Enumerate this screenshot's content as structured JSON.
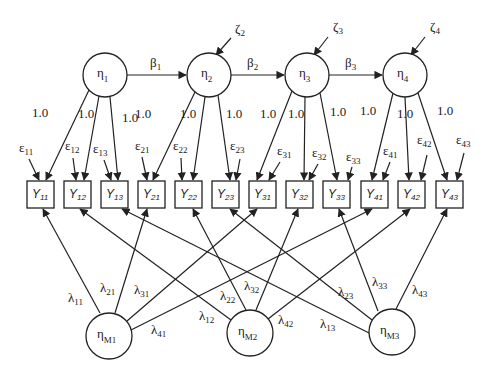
{
  "diagram": {
    "type": "structural-equation-model",
    "latent_factors": [
      {
        "id": "eta1",
        "symbol": "η",
        "sub": "1",
        "cx": 105,
        "cy": 75,
        "r": 22
      },
      {
        "id": "eta2",
        "symbol": "η",
        "sub": "2",
        "cx": 209,
        "cy": 75,
        "r": 22
      },
      {
        "id": "eta3",
        "symbol": "η",
        "sub": "3",
        "cx": 307,
        "cy": 75,
        "r": 22
      },
      {
        "id": "eta4",
        "symbol": "η",
        "sub": "4",
        "cx": 405,
        "cy": 75,
        "r": 22
      }
    ],
    "method_factors": [
      {
        "id": "etaM1",
        "symbol": "η",
        "sub": "M1",
        "cx": 109,
        "cy": 336,
        "r": 23
      },
      {
        "id": "etaM2",
        "symbol": "η",
        "sub": "M2",
        "cx": 250,
        "cy": 333,
        "r": 23
      },
      {
        "id": "etaM3",
        "symbol": "η",
        "sub": "M3",
        "cx": 392,
        "cy": 332,
        "r": 23
      }
    ],
    "disturbances": [
      {
        "id": "zeta2",
        "symbol": "ζ",
        "sub": "2",
        "target": "eta2",
        "lx": 235,
        "ly": 33,
        "x1": 231,
        "y1": 38,
        "x2": 216,
        "y2": 55
      },
      {
        "id": "zeta3",
        "symbol": "ζ",
        "sub": "3",
        "target": "eta3",
        "lx": 333,
        "ly": 31,
        "x1": 328,
        "y1": 37,
        "x2": 314,
        "y2": 55
      },
      {
        "id": "zeta4",
        "symbol": "ζ",
        "sub": "4",
        "target": "eta4",
        "lx": 430,
        "ly": 31,
        "x1": 425,
        "y1": 37,
        "x2": 411,
        "y2": 55
      }
    ],
    "structural_paths": [
      {
        "label": "β",
        "sub": "1",
        "from": "eta1",
        "to": "eta2",
        "lx": 150,
        "ly": 67
      },
      {
        "label": "β",
        "sub": "2",
        "from": "eta2",
        "to": "eta3",
        "lx": 247,
        "ly": 67
      },
      {
        "label": "β",
        "sub": "3",
        "from": "eta3",
        "to": "eta4",
        "lx": 345,
        "ly": 67
      }
    ],
    "indicators": [
      {
        "id": "Y11",
        "symbol": "Y",
        "sub": "11",
        "x": 27,
        "factor": "eta1",
        "method": "etaM1"
      },
      {
        "id": "Y12",
        "symbol": "Y",
        "sub": "12",
        "x": 64,
        "factor": "eta1",
        "method": "etaM2"
      },
      {
        "id": "Y13",
        "symbol": "Y",
        "sub": "13",
        "x": 101,
        "factor": "eta1",
        "method": "etaM3"
      },
      {
        "id": "Y21",
        "symbol": "Y",
        "sub": "21",
        "x": 138,
        "factor": "eta2",
        "method": "etaM1"
      },
      {
        "id": "Y22",
        "symbol": "Y",
        "sub": "22",
        "x": 175,
        "factor": "eta2",
        "method": "etaM2"
      },
      {
        "id": "Y23",
        "symbol": "Y",
        "sub": "23",
        "x": 212,
        "factor": "eta2",
        "method": "etaM3"
      },
      {
        "id": "Y31",
        "symbol": "Y",
        "sub": "31",
        "x": 249,
        "factor": "eta3",
        "method": "etaM1"
      },
      {
        "id": "Y32",
        "symbol": "Y",
        "sub": "32",
        "x": 286,
        "factor": "eta3",
        "method": "etaM2"
      },
      {
        "id": "Y33",
        "symbol": "Y",
        "sub": "33",
        "x": 323,
        "factor": "eta3",
        "method": "etaM3"
      },
      {
        "id": "Y41",
        "symbol": "Y",
        "sub": "41",
        "x": 361,
        "factor": "eta4",
        "method": "etaM1"
      },
      {
        "id": "Y42",
        "symbol": "Y",
        "sub": "42",
        "x": 398,
        "factor": "eta4",
        "method": "etaM2"
      },
      {
        "id": "Y43",
        "symbol": "Y",
        "sub": "43",
        "x": 436,
        "factor": "eta4",
        "method": "etaM3"
      }
    ],
    "indicator_box": {
      "y": 181,
      "w": 27,
      "h": 27
    },
    "factor_loadings": [
      {
        "from": "eta1",
        "to": "Y11",
        "label": "1.0",
        "lx": 32,
        "ly": 117,
        "ex": 46,
        "fx": 89,
        "fy": 90
      },
      {
        "from": "eta1",
        "to": "Y12",
        "label": "1.0",
        "lx": 78,
        "ly": 118,
        "ex": 84,
        "fx": 99,
        "fy": 96
      },
      {
        "from": "eta1",
        "to": "Y13",
        "label": "1.0",
        "lx": 122,
        "ly": 122,
        "ex": 118,
        "fx": 110,
        "fy": 97
      },
      {
        "from": "eta2",
        "to": "Y21",
        "label": "1.0",
        "lx": 135,
        "ly": 118,
        "ex": 153,
        "fx": 195,
        "fy": 92
      },
      {
        "from": "eta2",
        "to": "Y22",
        "label": "1.0",
        "lx": 180,
        "ly": 118,
        "ex": 193,
        "fx": 205,
        "fy": 97
      },
      {
        "from": "eta2",
        "to": "Y23",
        "label": "1.0",
        "lx": 226,
        "ly": 118,
        "ex": 230,
        "fx": 218,
        "fy": 95
      },
      {
        "from": "eta3",
        "to": "Y31",
        "label": "1.0",
        "lx": 260,
        "ly": 118,
        "ex": 257,
        "fx": 292,
        "fy": 91
      },
      {
        "from": "eta3",
        "to": "Y32",
        "label": "1.0",
        "lx": 288,
        "ly": 118,
        "ex": 304,
        "fx": 305,
        "fy": 97
      },
      {
        "from": "eta3",
        "to": "Y33",
        "label": "1.0",
        "lx": 330,
        "ly": 116,
        "ex": 337,
        "fx": 320,
        "fy": 93
      },
      {
        "from": "eta4",
        "to": "Y41",
        "label": "1.0",
        "lx": 360,
        "ly": 115,
        "ex": 372,
        "fx": 393,
        "fy": 93
      },
      {
        "from": "eta4",
        "to": "Y42",
        "label": "1.0",
        "lx": 397,
        "ly": 118,
        "ex": 409,
        "fx": 405,
        "fy": 97
      },
      {
        "from": "eta4",
        "to": "Y43",
        "label": "1.0",
        "lx": 437,
        "ly": 115,
        "ex": 447,
        "fx": 418,
        "fy": 93
      }
    ],
    "measurement_errors": [
      {
        "target": "Y11",
        "symbol": "ε",
        "sub": "11",
        "lx": 19,
        "ly": 152,
        "x1": 29,
        "y1": 159,
        "x2": 39,
        "y2": 180
      },
      {
        "target": "Y12",
        "symbol": "ε",
        "sub": "12",
        "lx": 65,
        "ly": 150,
        "x1": 73,
        "y1": 158,
        "x2": 76,
        "y2": 180
      },
      {
        "target": "Y13",
        "symbol": "ε",
        "sub": "13",
        "lx": 93,
        "ly": 153,
        "x1": 104,
        "y1": 160,
        "x2": 111,
        "y2": 180
      },
      {
        "target": "Y21",
        "symbol": "ε",
        "sub": "21",
        "lx": 135,
        "ly": 150,
        "x1": 142,
        "y1": 157,
        "x2": 147,
        "y2": 180
      },
      {
        "target": "Y22",
        "symbol": "ε",
        "sub": "22",
        "lx": 173,
        "ly": 150,
        "x1": 181,
        "y1": 158,
        "x2": 182,
        "y2": 180
      },
      {
        "target": "Y23",
        "symbol": "ε",
        "sub": "23",
        "lx": 230,
        "ly": 150,
        "x1": 240,
        "y1": 159,
        "x2": 236,
        "y2": 180
      },
      {
        "target": "Y31",
        "symbol": "ε",
        "sub": "31",
        "lx": 277,
        "ly": 155,
        "x1": 280,
        "y1": 162,
        "x2": 269,
        "y2": 180
      },
      {
        "target": "Y32",
        "symbol": "ε",
        "sub": "32",
        "lx": 312,
        "ly": 157,
        "x1": 318,
        "y1": 164,
        "x2": 309,
        "y2": 180
      },
      {
        "target": "Y33",
        "symbol": "ε",
        "sub": "33",
        "lx": 346,
        "ly": 161,
        "x1": 352,
        "y1": 167,
        "x2": 348,
        "y2": 180
      },
      {
        "target": "Y41",
        "symbol": "ε",
        "sub": "41",
        "lx": 383,
        "ly": 155,
        "x1": 390,
        "y1": 162,
        "x2": 383,
        "y2": 180
      },
      {
        "target": "Y42",
        "symbol": "ε",
        "sub": "42",
        "lx": 417,
        "ly": 144,
        "x1": 427,
        "y1": 155,
        "x2": 421,
        "y2": 180
      },
      {
        "target": "Y43",
        "symbol": "ε",
        "sub": "43",
        "lx": 456,
        "ly": 144,
        "x1": 464,
        "y1": 153,
        "x2": 457,
        "y2": 180
      }
    ],
    "method_loadings": [
      {
        "from": "etaM1",
        "to": "Y11",
        "symbol": "λ",
        "sub": "11",
        "lx": 68,
        "ly": 302,
        "sx": 100,
        "sy": 313,
        "ex": 43,
        "ey": 208
      },
      {
        "from": "etaM1",
        "to": "Y21",
        "symbol": "λ",
        "sub": "21",
        "lx": 100,
        "ly": 292,
        "sx": 115,
        "sy": 313,
        "ex": 147,
        "ey": 208
      },
      {
        "from": "etaM1",
        "to": "Y31",
        "symbol": "λ",
        "sub": "31",
        "lx": 134,
        "ly": 294,
        "sx": 127,
        "sy": 321,
        "ex": 257,
        "ey": 208
      },
      {
        "from": "etaM1",
        "to": "Y41",
        "symbol": "λ",
        "sub": "41",
        "lx": 151,
        "ly": 334,
        "sx": 131,
        "sy": 330,
        "ex": 372,
        "ey": 208
      },
      {
        "from": "etaM2",
        "to": "Y12",
        "symbol": "λ",
        "sub": "12",
        "lx": 199,
        "ly": 320,
        "sx": 231,
        "sy": 320,
        "ex": 80,
        "ey": 208
      },
      {
        "from": "etaM2",
        "to": "Y22",
        "symbol": "λ",
        "sub": "22",
        "lx": 220,
        "ly": 300,
        "sx": 246,
        "sy": 310,
        "ex": 193,
        "ey": 208
      },
      {
        "from": "etaM2",
        "to": "Y32",
        "symbol": "λ",
        "sub": "32",
        "lx": 244,
        "ly": 290,
        "sx": 256,
        "sy": 310,
        "ex": 298,
        "ey": 208
      },
      {
        "from": "etaM2",
        "to": "Y42",
        "symbol": "λ",
        "sub": "42",
        "lx": 278,
        "ly": 324,
        "sx": 268,
        "sy": 319,
        "ex": 410,
        "ey": 208
      },
      {
        "from": "etaM3",
        "to": "Y13",
        "symbol": "λ",
        "sub": "13",
        "lx": 320,
        "ly": 328,
        "sx": 369,
        "sy": 333,
        "ex": 122,
        "ey": 208
      },
      {
        "from": "etaM3",
        "to": "Y23",
        "symbol": "λ",
        "sub": "23",
        "lx": 338,
        "ly": 296,
        "sx": 372,
        "sy": 320,
        "ex": 230,
        "ey": 208
      },
      {
        "from": "etaM3",
        "to": "Y33",
        "symbol": "λ",
        "sub": "33",
        "lx": 372,
        "ly": 286,
        "sx": 378,
        "sy": 311,
        "ex": 339,
        "ey": 208
      },
      {
        "from": "etaM3",
        "to": "Y43",
        "symbol": "λ",
        "sub": "43",
        "lx": 412,
        "ly": 294,
        "sx": 396,
        "sy": 309,
        "ex": 447,
        "ey": 208
      }
    ]
  }
}
